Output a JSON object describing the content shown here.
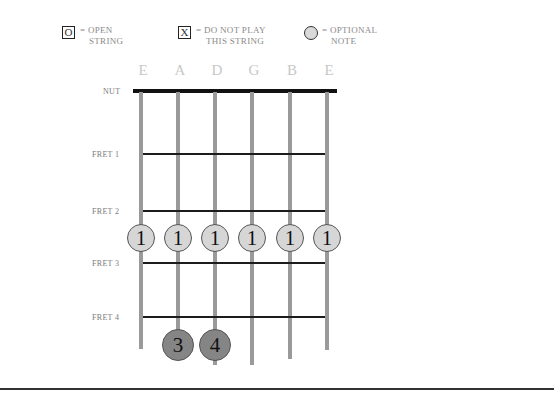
{
  "legend": [
    {
      "symbol": "O",
      "shape": "box",
      "line1": "= OPEN",
      "line2": "STRING"
    },
    {
      "symbol": "X",
      "shape": "box",
      "line1": "= DO NOT PLAY",
      "line2": "THIS STRING"
    },
    {
      "symbol": "",
      "shape": "circle",
      "line1": "= OPTIONAL",
      "line2": "NOTE"
    }
  ],
  "strings": [
    "E",
    "A",
    "D",
    "G",
    "B",
    "E"
  ],
  "nut_label": "NUT",
  "frets": [
    {
      "label": "FRET 1"
    },
    {
      "label": "FRET 2"
    },
    {
      "label": "FRET 3"
    },
    {
      "label": "FRET 4"
    }
  ],
  "fingers": [
    {
      "string": "E",
      "finger": "1",
      "type": "optional"
    },
    {
      "string": "A",
      "finger": "1",
      "type": "optional"
    },
    {
      "string": "D",
      "finger": "1",
      "type": "optional"
    },
    {
      "string": "G",
      "finger": "1",
      "type": "optional"
    },
    {
      "string": "B",
      "finger": "1",
      "type": "optional"
    },
    {
      "string": "E",
      "finger": "1",
      "type": "optional"
    },
    {
      "string": "A",
      "finger": "3",
      "type": "pressed"
    },
    {
      "string": "D",
      "finger": "4",
      "type": "pressed"
    }
  ],
  "colors": {
    "string": "#9a9a9a",
    "fret": "#1c1c1c",
    "optional_fill": "#d6d6d6",
    "pressed_fill": "#858585",
    "string_name": "#c8c8c8"
  }
}
